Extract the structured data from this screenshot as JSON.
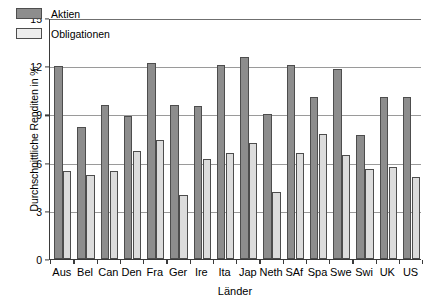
{
  "chart": {
    "type": "bar",
    "ylabel": "Durchschnittliche Renditen in %",
    "xlabel": "Länder",
    "legend": {
      "position": "top-left",
      "entries": [
        {
          "label": "Aktien",
          "color": "#8d8d8d",
          "name": "aktien"
        },
        {
          "label": "Obligationen",
          "color": "#ededed",
          "name": "obligationen"
        }
      ]
    },
    "yticks": [
      "0",
      "3",
      "6",
      "9",
      "12",
      "15"
    ]
  },
  "chart_data": {
    "type": "bar",
    "title": "",
    "subtitle": "",
    "xlabel": "Länder",
    "ylabel": "Durchschnittliche Renditen in %",
    "ylim": [
      0,
      15
    ],
    "yticks": [
      0,
      3,
      6,
      9,
      12,
      15
    ],
    "grid": true,
    "grid_axis": "y",
    "legend": [
      "Aktien",
      "Obligationen"
    ],
    "legend_position": "top-left",
    "categories": [
      "Aus",
      "Bel",
      "Can",
      "Den",
      "Fra",
      "Ger",
      "Ire",
      "Ita",
      "Jap",
      "Neth",
      "SAf",
      "Spa",
      "Swe",
      "Swi",
      "UK",
      "US"
    ],
    "series": [
      {
        "name": "Aktien",
        "color": "#8d8d8d",
        "values": [
          12.0,
          8.2,
          9.6,
          8.9,
          12.2,
          9.6,
          9.5,
          12.1,
          12.6,
          9.0,
          12.1,
          10.1,
          11.8,
          7.7,
          10.1,
          10.1
        ]
      },
      {
        "name": "Obligationen",
        "color": "#dcdcdc",
        "values": [
          5.5,
          5.2,
          5.5,
          6.7,
          7.4,
          4.0,
          6.2,
          6.6,
          7.2,
          4.2,
          6.6,
          7.8,
          6.5,
          5.6,
          5.7,
          5.1
        ]
      }
    ]
  }
}
